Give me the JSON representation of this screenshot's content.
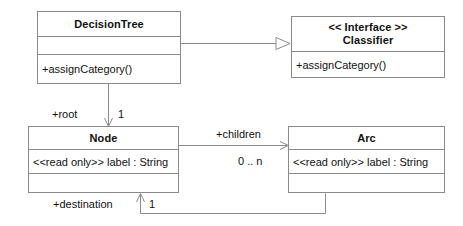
{
  "diagram": {
    "type": "uml-class-diagram",
    "background_color": "#ffffff",
    "line_color": "#8a8a8a",
    "text_color": "#111111"
  },
  "classes": {
    "decision_tree": {
      "name": "DecisionTree",
      "attributes": [],
      "operations": [
        "+assignCategory()"
      ]
    },
    "classifier": {
      "stereotype": "<< Interface >>",
      "name": "Classifier",
      "attributes": [],
      "operations": [
        "+assignCategory()"
      ]
    },
    "node": {
      "name": "Node",
      "attributes": [
        "<<read only>> label : String"
      ],
      "operations": []
    },
    "arc": {
      "name": "Arc",
      "attributes": [
        "<<read only>> label : String"
      ],
      "operations": []
    }
  },
  "relationships": {
    "realization": {
      "from": "DecisionTree",
      "to": "Classifier",
      "arrow": "hollow-triangle"
    },
    "root": {
      "from": "DecisionTree",
      "to": "Node",
      "role_label": "+root",
      "multiplicity": "1",
      "arrow": "open-arrow"
    },
    "children": {
      "from": "Node",
      "to": "Arc",
      "role_label": "+children",
      "multiplicity": "0 .. n",
      "arrow": "open-arrow"
    },
    "destination": {
      "from": "Arc",
      "to": "Node",
      "role_label": "+destination",
      "multiplicity": "1",
      "arrow": "open-arrow"
    }
  }
}
